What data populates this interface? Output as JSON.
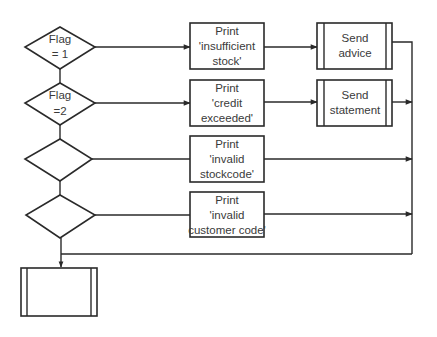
{
  "diagram": {
    "type": "flowchart",
    "colors": {
      "stroke": "#2a2a2a",
      "text": "#3a3a3a",
      "background": "#ffffff"
    },
    "decisions": [
      {
        "id": "d1",
        "line1": "Flag",
        "line2": "= 1"
      },
      {
        "id": "d2",
        "line1": "Flag",
        "line2": "=2"
      },
      {
        "id": "d3",
        "line1": "",
        "line2": ""
      },
      {
        "id": "d4",
        "line1": "",
        "line2": ""
      }
    ],
    "processes": [
      {
        "id": "p1",
        "line1": "Print",
        "line2": "'insufficient",
        "line3": "stock'"
      },
      {
        "id": "p2",
        "line1": "Print",
        "line2": "'credit",
        "line3": "exceeded'"
      },
      {
        "id": "p3",
        "line1": "Print",
        "line2": "'invalid",
        "line3": "stockcode'"
      },
      {
        "id": "p4",
        "line1": "Print",
        "line2": "'invalid",
        "line3": "customer code'"
      }
    ],
    "subroutines": [
      {
        "id": "s1",
        "line1": "Send",
        "line2": "advice"
      },
      {
        "id": "s2",
        "line1": "Send",
        "line2": "statement"
      },
      {
        "id": "s3",
        "line1": "",
        "line2": ""
      }
    ],
    "edges": [
      {
        "from": "d1",
        "to": "p1"
      },
      {
        "from": "p1",
        "to": "s1"
      },
      {
        "from": "d1",
        "to": "d2"
      },
      {
        "from": "d2",
        "to": "p2"
      },
      {
        "from": "p2",
        "to": "s2"
      },
      {
        "from": "d2",
        "to": "d3"
      },
      {
        "from": "d3",
        "to": "p3"
      },
      {
        "from": "d3",
        "to": "d4"
      },
      {
        "from": "d4",
        "to": "p4"
      },
      {
        "from": "d4",
        "to": "s3"
      },
      {
        "from": "s1",
        "to": "merge-line"
      },
      {
        "from": "s2",
        "to": "merge-line"
      },
      {
        "from": "p3",
        "to": "merge-line"
      },
      {
        "from": "p4",
        "to": "merge-line"
      },
      {
        "from": "merge-line",
        "to": "s3"
      }
    ]
  }
}
